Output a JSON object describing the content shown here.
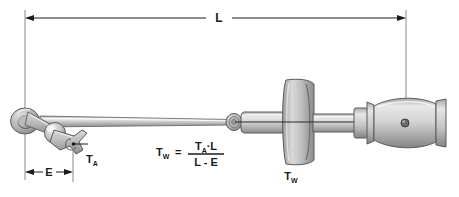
{
  "diagram": {
    "background_color": "#ffffff",
    "line_color": "#1a1a1a",
    "metal_light": "#e2e2e2",
    "metal_mid": "#bdbdbd",
    "metal_dark": "#8e8e8e",
    "metal_shadow": "#6f6f6f"
  },
  "dimensions": {
    "overall": {
      "label": "L",
      "name": "overall-length",
      "x_start": 25,
      "x_end": 406,
      "y": 18
    },
    "extension": {
      "label": "E",
      "name": "extension-length",
      "x_start": 25,
      "x_end": 73,
      "y": 172
    }
  },
  "labels": {
    "applied_torque": {
      "base": "T",
      "sub": "A",
      "name": "applied-torque-label"
    },
    "wrench_torque": {
      "base": "T",
      "sub": "W",
      "name": "wrench-torque-label"
    }
  },
  "formula": {
    "lhs_base": "T",
    "lhs_sub": "W",
    "equals": "=",
    "numerator_t": "T",
    "numerator_sub": "A",
    "numerator_dot": "·",
    "numerator_l": "L",
    "denominator": "L - E"
  },
  "parts": {
    "ring_eye": "crowfoot-ring-eye",
    "ball_joint": "ball-joint",
    "open_fork": "open-end-fork",
    "extension_bar": "extension-bar",
    "drive_ring": "square-drive-ring",
    "wrench_body": "wrench-body",
    "dial_gauge": "dial-gauge-plate",
    "shaft": "wrench-shaft",
    "collar": "handle-collar",
    "handle": "barrel-handle",
    "handle_pivot": "handle-pivot-dot",
    "handle_cap": "handle-end-cap"
  }
}
